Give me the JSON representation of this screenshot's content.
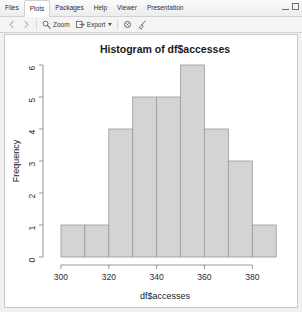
{
  "window": {
    "minimize_label": "minimize",
    "maximize_label": "maximize"
  },
  "tabs": [
    {
      "label": "Files",
      "active": false
    },
    {
      "label": "Plots",
      "active": true
    },
    {
      "label": "Packages",
      "active": false
    },
    {
      "label": "Help",
      "active": false
    },
    {
      "label": "Viewer",
      "active": false
    },
    {
      "label": "Presentation",
      "active": false
    }
  ],
  "toolbar": {
    "back_label": "",
    "forward_label": "",
    "zoom_label": "Zoom",
    "export_label": "Export",
    "remove_label": "",
    "clear_all_label": "",
    "publish_label": "Publish"
  },
  "chart_data": {
    "type": "bar",
    "title": "Histogram of df$accesses",
    "xlabel": "df$accesses",
    "ylabel": "Frequency",
    "categories": [
      "300-310",
      "310-320",
      "320-330",
      "330-340",
      "340-350",
      "350-360",
      "360-370",
      "370-380",
      "380-390"
    ],
    "bin_edges": [
      300,
      310,
      320,
      330,
      340,
      350,
      360,
      370,
      380,
      390
    ],
    "values": [
      1,
      1,
      4,
      5,
      5,
      6,
      4,
      3,
      1
    ],
    "xticks": [
      300,
      320,
      340,
      360,
      380
    ],
    "yticks": [
      0,
      1,
      2,
      3,
      4,
      5,
      6
    ],
    "xlim": [
      295,
      392
    ],
    "ylim": [
      0,
      6
    ],
    "grid": false,
    "legend": false,
    "bar_fill": "#d4d4d4",
    "bar_stroke": "#9a9a9a",
    "axis_color": "#8a8a8a"
  }
}
